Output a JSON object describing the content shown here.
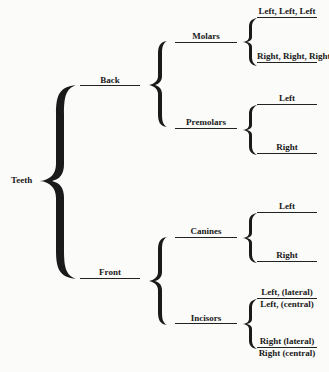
{
  "diagram": {
    "root": "Teeth",
    "level1": [
      {
        "label": "Back"
      },
      {
        "label": "Front"
      }
    ],
    "level2": [
      {
        "label": "Molars",
        "parent": "Back"
      },
      {
        "label": "Premolars",
        "parent": "Back"
      },
      {
        "label": "Canines",
        "parent": "Front"
      },
      {
        "label": "Incisors",
        "parent": "Front"
      }
    ],
    "leaves": {
      "molars": [
        "Left, Left, Left",
        "Right, Right, Right"
      ],
      "premolars": [
        "Left",
        "Right"
      ],
      "canines": [
        "Left",
        "Right"
      ],
      "incisors": [
        "Left, (lateral)",
        "Left, (central)",
        "Right (lateral)",
        "Right (central)"
      ]
    }
  }
}
